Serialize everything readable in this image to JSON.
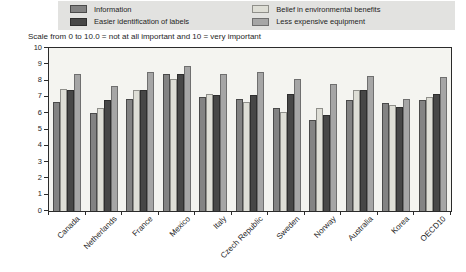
{
  "legend": {
    "background": "#e2e2e0",
    "items": [
      {
        "label": "Information",
        "color": "#838383",
        "border": "#4a4a4a"
      },
      {
        "label": "Easier identification of labels",
        "color": "#474747",
        "border": "#2e2e2e"
      },
      {
        "label": "Belief in environmental benefits",
        "color": "#deded6",
        "border": "#8f8f8a"
      },
      {
        "label": "Less expensive equipment",
        "color": "#a6a6a6",
        "border": "#6f6f6f"
      }
    ]
  },
  "note": "Scale from 0 to 10.0 = not at all important and 10 = very important",
  "chart_data": {
    "type": "bar",
    "title": "",
    "xlabel": "",
    "ylabel": "",
    "ylim": [
      0,
      10
    ],
    "yticks": [
      0,
      1,
      2,
      3,
      4,
      5,
      6,
      7,
      8,
      9,
      10
    ],
    "grid": false,
    "legend_position": "top",
    "plot_background": "#f4f4f0",
    "categories": [
      "Canada",
      "Netherlands",
      "France",
      "Mexico",
      "Italy",
      "Czech Republic",
      "Sweden",
      "Norway",
      "Australia",
      "Korea",
      "OECD10"
    ],
    "series": [
      {
        "name": "Information",
        "color": "#838383",
        "border": "#4a4a4a",
        "values": [
          6.7,
          6.0,
          6.9,
          8.4,
          7.0,
          6.9,
          6.3,
          5.6,
          6.8,
          6.6,
          6.8
        ]
      },
      {
        "name": "Belief in environmental benefits",
        "color": "#deded6",
        "border": "#8f8f8a",
        "values": [
          7.5,
          6.3,
          7.4,
          8.1,
          7.2,
          6.7,
          6.1,
          6.3,
          7.4,
          6.5,
          7.0
        ]
      },
      {
        "name": "Easier identification of labels",
        "color": "#474747",
        "border": "#2e2e2e",
        "values": [
          7.4,
          6.8,
          7.4,
          8.4,
          7.1,
          7.1,
          7.2,
          5.9,
          7.4,
          6.4,
          7.2
        ]
      },
      {
        "name": "Less expensive equipment",
        "color": "#a6a6a6",
        "border": "#6f6f6f",
        "values": [
          8.4,
          7.7,
          8.5,
          8.9,
          8.4,
          8.5,
          8.1,
          7.8,
          8.3,
          6.9,
          8.2
        ]
      }
    ]
  }
}
